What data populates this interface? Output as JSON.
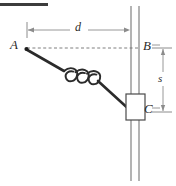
{
  "figure": {
    "background_color": "#ffffff",
    "stroke_color": "#2b2b2b",
    "rod_color": "#8c8c8c",
    "dimension_color": "#8c8c8c",
    "top_rule": {
      "name": "top-rule",
      "color": "#3c3c3c",
      "x": 0,
      "y": 3,
      "width": 48,
      "height": 3
    },
    "labels": {
      "point_a": "A",
      "point_b": "B",
      "point_c": "C",
      "distance_d": "d",
      "distance_s": "s"
    },
    "geometry": {
      "point_a": {
        "x": 26,
        "y": 49
      },
      "point_b": {
        "x": 135,
        "y": 48
      },
      "point_c": {
        "x": 135,
        "y": 112
      },
      "rod_line_left_x": 131,
      "rod_line_right_x": 139,
      "rod_top_y": 6,
      "rod_bottom_y": 181,
      "block": {
        "x": 126,
        "y": 94,
        "width": 19,
        "height": 26
      },
      "dim_d_y": 30,
      "dim_d_x_start": 27,
      "dim_d_x_end": 131,
      "dim_s_x": 163,
      "dim_s_y_start": 48,
      "dim_s_y_end": 112,
      "dashed_line_y": 48,
      "spring_coils": 3
    }
  }
}
